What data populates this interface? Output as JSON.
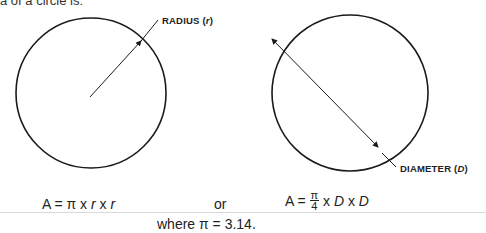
{
  "header": {
    "partial_text": "a of a circle is:"
  },
  "diagram": {
    "left_circle": {
      "label_main": "RADIUS",
      "label_var": "r"
    },
    "right_circle": {
      "label_main": "DIAMETER",
      "label_var": "D"
    }
  },
  "formulas": {
    "radius_formula": {
      "prefix": "A = π x ",
      "v1": "r",
      "mid": " x ",
      "v2": "r"
    },
    "connector": "or",
    "diameter_formula": {
      "prefix": "A = ",
      "num": "π",
      "den": "4",
      "mid1": " x ",
      "v1": "D",
      "mid2": " x ",
      "v2": "D"
    },
    "note": "where π = 3.14."
  },
  "colors": {
    "stroke": "#1a1a1a",
    "rule": "#d9d9d9"
  }
}
